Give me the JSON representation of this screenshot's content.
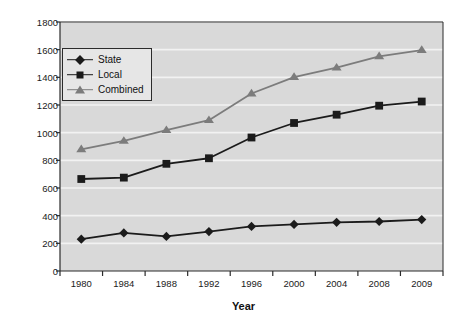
{
  "chart_data": {
    "type": "line",
    "title": "",
    "xlabel": "Year",
    "ylabel": "In thousands",
    "categories": [
      "1980",
      "1984",
      "1988",
      "1992",
      "1996",
      "2000",
      "2004",
      "2008",
      "2009"
    ],
    "ylim": [
      0,
      1800
    ],
    "yticks": [
      0,
      200,
      400,
      600,
      800,
      1000,
      1200,
      1400,
      1600,
      1800
    ],
    "grid": "horizontal",
    "legend_position": "upper-left-inside",
    "series": [
      {
        "name": "State",
        "marker": "diamond",
        "color": "#1b1b1b",
        "values": [
          230,
          275,
          250,
          285,
          322,
          337,
          352,
          358,
          372
        ]
      },
      {
        "name": "Local",
        "marker": "square",
        "color": "#1b1b1b",
        "values": [
          665,
          675,
          775,
          815,
          965,
          1070,
          1130,
          1195,
          1225
        ]
      },
      {
        "name": "Combined",
        "marker": "triangle",
        "color": "#7c7c7c",
        "values": [
          880,
          940,
          1018,
          1090,
          1283,
          1402,
          1470,
          1552,
          1597
        ]
      }
    ]
  },
  "style": {
    "plot_background": "#d9d9d9",
    "gridline_color": "#f2f2f2",
    "axis_color": "#2b2b2b",
    "page_background": "#ffffff"
  }
}
